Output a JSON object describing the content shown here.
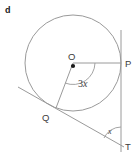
{
  "figure": {
    "part_label": "d",
    "background_color": "#ffffff",
    "stroke_color": "#8a8a8a",
    "label_color": "#3c3c3c",
    "circle": {
      "center_label": "O",
      "center_x": 73,
      "center_y": 63,
      "radius": 48
    },
    "points": [
      {
        "name": "center-point-o",
        "label": "O",
        "x": 73,
        "y": 63,
        "label_x": 70,
        "label_y": 60
      },
      {
        "name": "point-p",
        "label": "P",
        "x": 121,
        "y": 63,
        "label_x": 126,
        "label_y": 66
      },
      {
        "name": "point-q",
        "label": "Q",
        "x": 56,
        "y": 108,
        "label_x": 44,
        "label_y": 120
      },
      {
        "name": "point-t",
        "label": "T",
        "x": 121,
        "y": 146,
        "label_x": 126,
        "label_y": 150
      }
    ],
    "segments": [
      {
        "name": "radius-op",
        "from": "O",
        "to": "P"
      },
      {
        "name": "radius-oq",
        "from": "O",
        "to": "Q"
      },
      {
        "name": "tangent-line-qt",
        "from": "Q",
        "to": "T"
      },
      {
        "name": "tangent-line-pt",
        "from": "P",
        "to": "T"
      }
    ],
    "angles": [
      {
        "name": "angle-at-center",
        "vertex": "O",
        "value_text": "3x",
        "coefficient": "3",
        "variable": "x",
        "label_x": 78,
        "label_y": 86
      },
      {
        "name": "angle-at-t",
        "vertex": "T",
        "value_text": "x",
        "variable": "x",
        "label_x": 110,
        "label_y": 133
      }
    ]
  }
}
